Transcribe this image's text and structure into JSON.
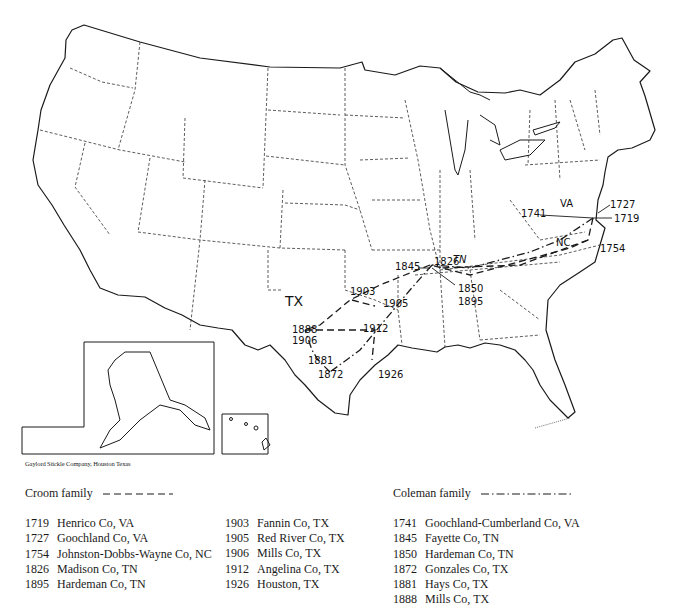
{
  "map": {
    "state_labels": [
      "VA",
      "TN",
      "NC",
      "TX"
    ],
    "point_labels": [
      {
        "text": "1727",
        "x": 610,
        "y": 205
      },
      {
        "text": "1719",
        "x": 614,
        "y": 220
      },
      {
        "text": "1741",
        "x": 522,
        "y": 215
      },
      {
        "text": "1754",
        "x": 600,
        "y": 248
      },
      {
        "text": "1826",
        "x": 434,
        "y": 264
      },
      {
        "text": "1845",
        "x": 395,
        "y": 269
      },
      {
        "text": "1850",
        "x": 466,
        "y": 287
      },
      {
        "text": "1895",
        "x": 466,
        "y": 300
      },
      {
        "text": "1903",
        "x": 350,
        "y": 294
      },
      {
        "text": "1905",
        "x": 387,
        "y": 304
      },
      {
        "text": "1888",
        "x": 293,
        "y": 332
      },
      {
        "text": "1906",
        "x": 293,
        "y": 344
      },
      {
        "text": "1912",
        "x": 364,
        "y": 331
      },
      {
        "text": "1881",
        "x": 308,
        "y": 361
      },
      {
        "text": "1872",
        "x": 318,
        "y": 375
      },
      {
        "text": "1926",
        "x": 378,
        "y": 374
      }
    ],
    "credit": "Gaylord Stickle Company, Houston Texas"
  },
  "legend": {
    "croom": {
      "title": "Croom family",
      "line_style": "dashed",
      "entries": [
        {
          "year": "1719",
          "place": "Henrico Co, VA"
        },
        {
          "year": "1727",
          "place": "Goochland Co, VA"
        },
        {
          "year": "1754",
          "place": "Johnston-Dobbs-Wayne Co, NC"
        },
        {
          "year": "1826",
          "place": "Madison Co, TN"
        },
        {
          "year": "1895",
          "place": "Hardeman Co, TN"
        },
        {
          "year": "1903",
          "place": "Fannin Co, TX"
        },
        {
          "year": "1905",
          "place": "Red River Co, TX"
        },
        {
          "year": "1906",
          "place": "Mills Co, TX"
        },
        {
          "year": "1912",
          "place": "Angelina Co, TX"
        },
        {
          "year": "1926",
          "place": "Houston, TX"
        }
      ]
    },
    "coleman": {
      "title": "Coleman family",
      "line_style": "dash-dot",
      "entries": [
        {
          "year": "1741",
          "place": "Goochland-Cumberland Co, VA"
        },
        {
          "year": "1845",
          "place": "Fayette Co, TN"
        },
        {
          "year": "1850",
          "place": "Hardeman Co, TN"
        },
        {
          "year": "1872",
          "place": "Gonzales Co, TX"
        },
        {
          "year": "1881",
          "place": "Hays Co, TX"
        },
        {
          "year": "1888",
          "place": "Mills Co, TX"
        }
      ]
    }
  }
}
